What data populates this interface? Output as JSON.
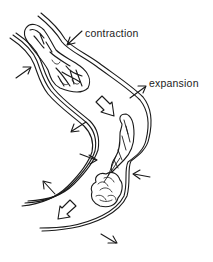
{
  "diagram": {
    "labels": {
      "contraction": "contraction",
      "expansion": "expansion"
    },
    "colors": {
      "line": "#1a1a1a",
      "background": "#ffffff"
    },
    "arrows": {
      "inward": [
        "contraction-arrow-upper",
        "left-inward-arrow",
        "mid-inward-arrow",
        "right-inward-arrow"
      ],
      "outward": [
        "expansion-arrow",
        "left-outward-arrow-upper",
        "left-outward-arrow-lower",
        "bottom-outward-arrow"
      ],
      "flow": [
        "flow-arrow-middle",
        "flow-arrow-bottom"
      ]
    }
  }
}
